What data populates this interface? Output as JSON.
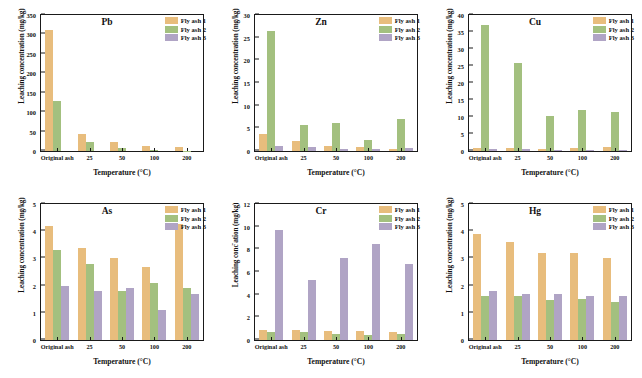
{
  "figure": {
    "series_names": [
      "Fly ash 1",
      "Fly ash 2",
      "Fly ash 3"
    ],
    "series_colors": [
      "#e8bd7d",
      "#a3c07f",
      "#b0a4c5"
    ],
    "categories": [
      "Original ash",
      "25",
      "50",
      "100",
      "200"
    ],
    "xlabel": "Temperature (°C)",
    "ylabel": "Leaching concentration (mg/kg)"
  },
  "chart_data": [
    {
      "type": "bar",
      "title": "Pb",
      "xlabel": "Temperature (°C)",
      "ylabel": "Leaching concentration (mg/kg)",
      "categories": [
        "Original ash",
        "25",
        "50",
        "100",
        "200"
      ],
      "ylim": [
        0,
        350
      ],
      "yticks": [
        0,
        50,
        100,
        150,
        200,
        250,
        300,
        350
      ],
      "grid": false,
      "legend_position": "top-right",
      "series": [
        {
          "name": "Fly ash 1",
          "values": [
            312,
            44,
            22,
            13,
            11
          ]
        },
        {
          "name": "Fly ash 2",
          "values": [
            128,
            23,
            7,
            3,
            1
          ]
        },
        {
          "name": "Fly ash 3",
          "values": [
            0,
            0,
            0,
            0,
            0
          ]
        }
      ]
    },
    {
      "type": "bar",
      "title": "Zn",
      "xlabel": "Temperature (°C)",
      "ylabel": "Leaching concentration (mg/kg)",
      "categories": [
        "Original ash",
        "25",
        "50",
        "100",
        "200"
      ],
      "ylim": [
        0,
        30
      ],
      "yticks": [
        0,
        5,
        10,
        15,
        20,
        25,
        30
      ],
      "grid": false,
      "legend_position": "top-right",
      "series": [
        {
          "name": "Fly ash 1",
          "values": [
            3.8,
            2.3,
            1.1,
            0.9,
            0.5
          ]
        },
        {
          "name": "Fly ash 2",
          "values": [
            26.5,
            5.7,
            6.2,
            2.4,
            7.0
          ]
        },
        {
          "name": "Fly ash 3",
          "values": [
            1.2,
            0.8,
            0.5,
            0.4,
            0.6
          ]
        }
      ]
    },
    {
      "type": "bar",
      "title": "Cu",
      "xlabel": "Temperature (°C)",
      "ylabel": "Leaching concentration (mg/kg)",
      "categories": [
        "Original ash",
        "25",
        "50",
        "100",
        "200"
      ],
      "ylim": [
        0,
        40
      ],
      "yticks": [
        0,
        5,
        10,
        15,
        20,
        25,
        30,
        35,
        40
      ],
      "grid": false,
      "legend_position": "top-right",
      "series": [
        {
          "name": "Fly ash 1",
          "values": [
            1.0,
            0.8,
            0.7,
            0.9,
            1.1
          ]
        },
        {
          "name": "Fly ash 2",
          "values": [
            37.0,
            25.9,
            10.4,
            12.0,
            11.6
          ]
        },
        {
          "name": "Fly ash 3",
          "values": [
            0.7,
            0.5,
            0.4,
            0.4,
            0.4
          ]
        }
      ]
    },
    {
      "type": "bar",
      "title": "As",
      "xlabel": "Temperature (°C)",
      "ylabel": "Leaching concentration (mg/kg)",
      "categories": [
        "Original ash",
        "25",
        "50",
        "100",
        "200"
      ],
      "ylim": [
        0,
        5
      ],
      "yticks": [
        0,
        1,
        2,
        3,
        4,
        5
      ],
      "grid": false,
      "legend_position": "top-right",
      "series": [
        {
          "name": "Fly ash 1",
          "values": [
            4.2,
            3.4,
            3.0,
            2.7,
            4.25
          ]
        },
        {
          "name": "Fly ash 2",
          "values": [
            3.3,
            2.8,
            1.8,
            2.1,
            1.9
          ]
        },
        {
          "name": "Fly ash 3",
          "values": [
            2.0,
            1.8,
            1.9,
            1.1,
            1.7
          ]
        }
      ]
    },
    {
      "type": "bar",
      "title": "Cr",
      "xlabel": "Temperature (°C)",
      "ylabel": "Leaching conc᷈ ation (mg/kg)",
      "categories": [
        "Original ash",
        "25",
        "50",
        "100",
        "200"
      ],
      "ylim": [
        0,
        12
      ],
      "yticks": [
        0,
        2,
        4,
        6,
        8,
        10,
        12
      ],
      "grid": false,
      "legend_position": "top-right",
      "series": [
        {
          "name": "Fly ash 1",
          "values": [
            0.9,
            0.9,
            0.8,
            0.8,
            0.7
          ]
        },
        {
          "name": "Fly ash 2",
          "values": [
            0.75,
            0.7,
            0.55,
            0.45,
            0.55
          ]
        },
        {
          "name": "Fly ash 3",
          "values": [
            9.7,
            5.3,
            7.2,
            8.5,
            6.7
          ]
        }
      ]
    },
    {
      "type": "bar",
      "title": "Hg",
      "xlabel": "Temperature (°C)",
      "ylabel": "Leaching concentration (mg/kg)",
      "categories": [
        "Original ash",
        "25",
        "50",
        "100",
        "200"
      ],
      "ylim": [
        0,
        5
      ],
      "yticks": [
        0,
        1,
        2,
        3,
        4,
        5
      ],
      "grid": false,
      "legend_position": "top-right",
      "series": [
        {
          "name": "Fly ash 1",
          "values": [
            3.9,
            3.6,
            3.2,
            3.2,
            3.0
          ]
        },
        {
          "name": "Fly ash 2",
          "values": [
            1.6,
            1.6,
            1.47,
            1.5,
            1.4
          ]
        },
        {
          "name": "Fly ash 3",
          "values": [
            1.8,
            1.7,
            1.7,
            1.6,
            1.6
          ]
        }
      ]
    }
  ]
}
